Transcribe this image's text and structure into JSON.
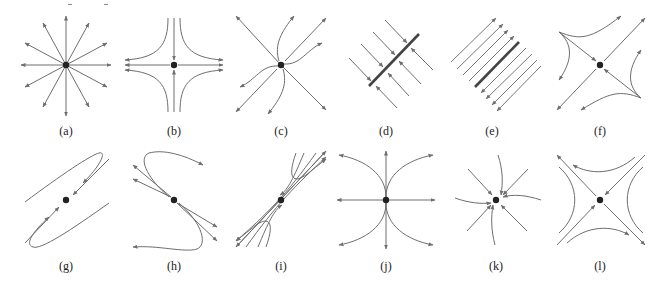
{
  "figure": {
    "stroke_color": "#6e6e6e",
    "fixed_point_color": "#222222",
    "panels": [
      {
        "id": "a",
        "label": "(a)",
        "type": "star-source",
        "description": "unstable star node: straight rays radiating outward"
      },
      {
        "id": "b",
        "label": "(b)",
        "type": "saddle-axes",
        "description": "saddle: inflow on vertical axis, outflow on horizontal axis, hyperbolas"
      },
      {
        "id": "c",
        "label": "(c)",
        "type": "unstable-node",
        "description": "unstable node with curved trajectories tangent to one direction"
      },
      {
        "id": "d",
        "label": "(d)",
        "type": "line-of-stable-fixed-points",
        "description": "line of fixed points with parallel trajectories flowing into it"
      },
      {
        "id": "e",
        "label": "(e)",
        "type": "uniform-shear",
        "description": "line of fixed points with parallel flow along lines (shear)"
      },
      {
        "id": "f",
        "label": "(f)",
        "type": "saddle-diagonal",
        "description": "saddle with diagonal stable and unstable manifolds"
      },
      {
        "id": "g",
        "label": "(g)",
        "type": "saddle-elongated",
        "description": "degenerate-looking saddle with elongated curving trajectories"
      },
      {
        "id": "h",
        "label": "(h)",
        "type": "saddle-curved",
        "description": "saddle with outgoing trajectories bending back"
      },
      {
        "id": "i",
        "label": "(i)",
        "type": "saddle-narrow",
        "description": "narrow saddle along a diagonal with cusp-like trajectories"
      },
      {
        "id": "j",
        "label": "(j)",
        "type": "unstable-node-vertical",
        "description": "unstable node with parabolic trajectories tangent to vertical axis"
      },
      {
        "id": "k",
        "label": "(k)",
        "type": "stable-spiral-node",
        "description": "stable node with slightly curved inflowing trajectories"
      },
      {
        "id": "l",
        "label": "(l)",
        "type": "saddle-standard",
        "description": "standard saddle with diagonal manifolds and hyperbolic trajectories"
      }
    ]
  }
}
